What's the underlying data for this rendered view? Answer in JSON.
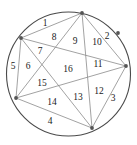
{
  "figure": {
    "colors": {
      "background": "#ffffff",
      "circle_stroke": "#4a4a4a",
      "chord_stroke": "#8a8a8a",
      "vertex_fill": "#555555",
      "label_text": "#1a1a1a"
    },
    "circle": {
      "cx": 68.5,
      "cy": 74,
      "r": 62
    },
    "vertices": [
      {
        "name": "vertex-top",
        "x": 82,
        "y": 13
      },
      {
        "name": "vertex-upper-left",
        "x": 21,
        "y": 38
      },
      {
        "name": "vertex-right",
        "x": 126,
        "y": 66
      },
      {
        "name": "vertex-lower-left",
        "x": 16,
        "y": 98
      },
      {
        "name": "vertex-bottom",
        "x": 92,
        "y": 128
      },
      {
        "name": "vertex-upper-right",
        "x": 118,
        "y": 33
      }
    ],
    "chords": [
      {
        "from": 0,
        "to": 1
      },
      {
        "from": 0,
        "to": 2
      },
      {
        "from": 0,
        "to": 3
      },
      {
        "from": 0,
        "to": 4
      },
      {
        "from": 1,
        "to": 2
      },
      {
        "from": 1,
        "to": 3
      },
      {
        "from": 1,
        "to": 4
      },
      {
        "from": 2,
        "to": 3
      },
      {
        "from": 2,
        "to": 4
      },
      {
        "from": 3,
        "to": 4
      }
    ],
    "regions": [
      {
        "label": "1",
        "x": 45,
        "y": 24
      },
      {
        "label": "2",
        "x": 107,
        "y": 37
      },
      {
        "label": "3",
        "x": 113,
        "y": 99
      },
      {
        "label": "4",
        "x": 50,
        "y": 122
      },
      {
        "label": "5",
        "x": 13,
        "y": 67
      },
      {
        "label": "6",
        "x": 28,
        "y": 67
      },
      {
        "label": "7",
        "x": 40,
        "y": 52
      },
      {
        "label": "8",
        "x": 54,
        "y": 38
      },
      {
        "label": "9",
        "x": 75,
        "y": 42
      },
      {
        "label": "10",
        "x": 97,
        "y": 43
      },
      {
        "label": "11",
        "x": 98,
        "y": 65
      },
      {
        "label": "12",
        "x": 99,
        "y": 92
      },
      {
        "label": "13",
        "x": 78,
        "y": 98
      },
      {
        "label": "14",
        "x": 52,
        "y": 103
      },
      {
        "label": "15",
        "x": 42,
        "y": 84
      },
      {
        "label": "16",
        "x": 68,
        "y": 70
      }
    ]
  }
}
